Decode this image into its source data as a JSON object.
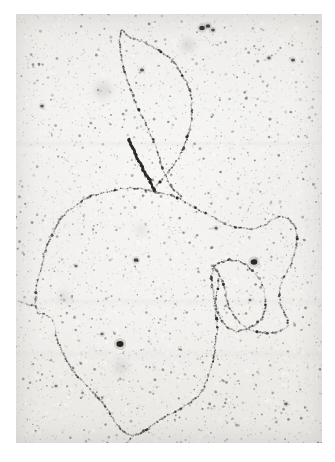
{
  "image": {
    "kind": "electron-micrograph",
    "subject": "DNA molecule spread",
    "caption": "",
    "plate": {
      "x": 16,
      "y": 14,
      "width": 306,
      "height": 429,
      "border_color": "#ffffff",
      "background_color": "#ededeb",
      "filament_color": "#2a2a28",
      "grain_color": "#555550"
    },
    "features": {
      "main_loop_label": "large closed circular DNA loop",
      "upper_loop_label": "upper open DNA loop",
      "right_lobe_label": "right side bulge loop",
      "dark_segment_label": "short dense overlapping strand",
      "branch_point_label": "strand junction / branch point"
    },
    "chart_data": {
      "type": "scatter",
      "title": "",
      "xlabel": "",
      "ylabel": "",
      "grid": false,
      "legend": "none",
      "traces": [
        {
          "name": "main-loop",
          "closed": true,
          "points": [
            [
              138,
              178
            ],
            [
              152,
              180
            ],
            [
              166,
              186
            ],
            [
              180,
              194
            ],
            [
              196,
              203
            ],
            [
              210,
              210
            ],
            [
              222,
              214
            ],
            [
              236,
              215
            ],
            [
              249,
              211
            ],
            [
              258,
              205
            ],
            [
              266,
              202
            ],
            [
              274,
              205
            ],
            [
              279,
              213
            ],
            [
              281,
              224
            ],
            [
              280,
              236
            ],
            [
              276,
              247
            ],
            [
              271,
              257
            ],
            [
              266,
              268
            ],
            [
              263,
              279
            ],
            [
              264,
              290
            ],
            [
              268,
              298
            ],
            [
              272,
              304
            ],
            [
              272,
              311
            ],
            [
              266,
              316
            ],
            [
              257,
              319
            ],
            [
              246,
              319
            ],
            [
              235,
              316
            ],
            [
              226,
              311
            ],
            [
              219,
              304
            ],
            [
              214,
              295
            ],
            [
              211,
              286
            ],
            [
              209,
              276
            ],
            [
              206,
              266
            ],
            [
              202,
              258
            ],
            [
              198,
              252
            ],
            [
              196,
              260
            ],
            [
              196,
              272
            ],
            [
              198,
              286
            ],
            [
              200,
              300
            ],
            [
              201,
              314
            ],
            [
              200,
              328
            ],
            [
              198,
              341
            ],
            [
              195,
              353
            ],
            [
              192,
              364
            ],
            [
              188,
              374
            ],
            [
              182,
              382
            ],
            [
              174,
              389
            ],
            [
              164,
              395
            ],
            [
              152,
              401
            ],
            [
              141,
              408
            ],
            [
              132,
              414
            ],
            [
              124,
              419
            ],
            [
              117,
              422
            ],
            [
              110,
              420
            ],
            [
              104,
              414
            ],
            [
              98,
              406
            ],
            [
              92,
              397
            ],
            [
              86,
              388
            ],
            [
              79,
              380
            ],
            [
              72,
              373
            ],
            [
              65,
              366
            ],
            [
              58,
              358
            ],
            [
              52,
              349
            ],
            [
              47,
              340
            ],
            [
              43,
              330
            ],
            [
              40,
              320
            ],
            [
              38,
              310
            ],
            [
              34,
              303
            ],
            [
              28,
              300
            ],
            [
              23,
              299
            ],
            [
              20,
              294
            ],
            [
              19,
              285
            ],
            [
              20,
              274
            ],
            [
              23,
              262
            ],
            [
              26,
              250
            ],
            [
              29,
              238
            ],
            [
              33,
              227
            ],
            [
              38,
              216
            ],
            [
              44,
              206
            ],
            [
              52,
              197
            ],
            [
              61,
              190
            ],
            [
              71,
              184
            ],
            [
              82,
              180
            ],
            [
              94,
              177
            ],
            [
              106,
              175
            ],
            [
              117,
              174
            ],
            [
              128,
              175
            ]
          ]
        },
        {
          "name": "upper-loop",
          "closed": false,
          "points": [
            [
              137,
              177
            ],
            [
              142,
              170
            ],
            [
              148,
              163
            ],
            [
              155,
              155
            ],
            [
              161,
              146
            ],
            [
              166,
              137
            ],
            [
              170,
              128
            ],
            [
              173,
              118
            ],
            [
              175,
              108
            ],
            [
              176,
              98
            ],
            [
              176,
              88
            ],
            [
              174,
              78
            ],
            [
              171,
              69
            ],
            [
              166,
              60
            ],
            [
              160,
              51
            ],
            [
              152,
              43
            ],
            [
              143,
              36
            ],
            [
              133,
              31
            ],
            [
              124,
              27
            ],
            [
              116,
              24
            ],
            [
              110,
              20
            ],
            [
              106,
              15
            ]
          ]
        },
        {
          "name": "upper-right-strand",
          "closed": false,
          "points": [
            [
              106,
              15
            ],
            [
              104,
              23
            ],
            [
              104,
              32
            ],
            [
              105,
              42
            ],
            [
              107,
              52
            ],
            [
              110,
              62
            ],
            [
              113,
              72
            ],
            [
              117,
              82
            ],
            [
              121,
              92
            ],
            [
              125,
              101
            ],
            [
              130,
              110
            ],
            [
              134,
              119
            ],
            [
              138,
              128
            ],
            [
              141,
              137
            ],
            [
              144,
              146
            ],
            [
              147,
              155
            ],
            [
              150,
              163
            ],
            [
              154,
              171
            ],
            [
              159,
              177
            ],
            [
              166,
              182
            ]
          ]
        },
        {
          "name": "dense-short-segment",
          "closed": false,
          "points": [
            [
              113,
              125
            ],
            [
              116,
              133
            ],
            [
              120,
              141
            ],
            [
              124,
              149
            ],
            [
              128,
              157
            ],
            [
              132,
              164
            ],
            [
              136,
              171
            ],
            [
              139,
              177
            ]
          ]
        },
        {
          "name": "right-lobe",
          "closed": false,
          "points": [
            [
              196,
              252
            ],
            [
              204,
              248
            ],
            [
              213,
              246
            ],
            [
              222,
              247
            ],
            [
              231,
              251
            ],
            [
              238,
              258
            ],
            [
              244,
              266
            ],
            [
              248,
              276
            ],
            [
              250,
              286
            ],
            [
              249,
              296
            ],
            [
              245,
              305
            ],
            [
              238,
              312
            ],
            [
              229,
              316
            ],
            [
              220,
              317
            ],
            [
              212,
              314
            ],
            [
              206,
              308
            ],
            [
              202,
              300
            ],
            [
              200,
              291
            ],
            [
              200,
              281
            ],
            [
              202,
              271
            ],
            [
              203,
              261
            ]
          ]
        },
        {
          "name": "lower-tail",
          "closed": false,
          "points": [
            [
              117,
              422
            ],
            [
              112,
              428
            ],
            [
              107,
              432
            ],
            [
              101,
              433
            ],
            [
              95,
              431
            ],
            [
              90,
              427
            ]
          ]
        },
        {
          "name": "left-stub",
          "closed": false,
          "points": [
            [
              20,
              292
            ],
            [
              13,
              291
            ],
            [
              7,
              289
            ],
            [
              2,
              286
            ]
          ]
        }
      ],
      "dark_blobs": [
        {
          "cx": 238,
          "cy": 248,
          "r": 3.2,
          "opacity": 0.92
        },
        {
          "cx": 104,
          "cy": 330,
          "r": 3.4,
          "opacity": 0.95
        },
        {
          "cx": 120,
          "cy": 246,
          "r": 2.2,
          "opacity": 0.78
        },
        {
          "cx": 186,
          "cy": 14,
          "r": 2.6,
          "opacity": 0.85
        },
        {
          "cx": 192,
          "cy": 12,
          "r": 2.2,
          "opacity": 0.8
        },
        {
          "cx": 197,
          "cy": 16,
          "r": 1.8,
          "opacity": 0.72
        },
        {
          "cx": 277,
          "cy": 46,
          "r": 1.9,
          "opacity": 0.7
        },
        {
          "cx": 253,
          "cy": 44,
          "r": 1.7,
          "opacity": 0.62
        },
        {
          "cx": 26,
          "cy": 92,
          "r": 1.8,
          "opacity": 0.66
        },
        {
          "cx": 126,
          "cy": 56,
          "r": 1.9,
          "opacity": 0.68
        },
        {
          "cx": 86,
          "cy": 320,
          "r": 1.6,
          "opacity": 0.6
        },
        {
          "cx": 60,
          "cy": 252,
          "r": 1.5,
          "opacity": 0.58
        },
        {
          "cx": 200,
          "cy": 214,
          "r": 1.6,
          "opacity": 0.6
        },
        {
          "cx": 270,
          "cy": 390,
          "r": 1.7,
          "opacity": 0.58
        },
        {
          "cx": 160,
          "cy": 440,
          "r": 1.5,
          "opacity": 0.55
        },
        {
          "cx": 234,
          "cy": 286,
          "r": 1.4,
          "opacity": 0.52
        },
        {
          "cx": 40,
          "cy": 372,
          "r": 1.4,
          "opacity": 0.52
        }
      ],
      "diffuse_blobs": [
        {
          "cx": 87,
          "cy": 76,
          "r": 9,
          "opacity": 0.15
        },
        {
          "cx": 172,
          "cy": 31,
          "r": 7,
          "opacity": 0.16
        },
        {
          "cx": 105,
          "cy": 353,
          "r": 8,
          "opacity": 0.12
        },
        {
          "cx": 48,
          "cy": 282,
          "r": 6,
          "opacity": 0.12
        },
        {
          "cx": 125,
          "cy": 216,
          "r": 6,
          "opacity": 0.1
        }
      ]
    }
  }
}
